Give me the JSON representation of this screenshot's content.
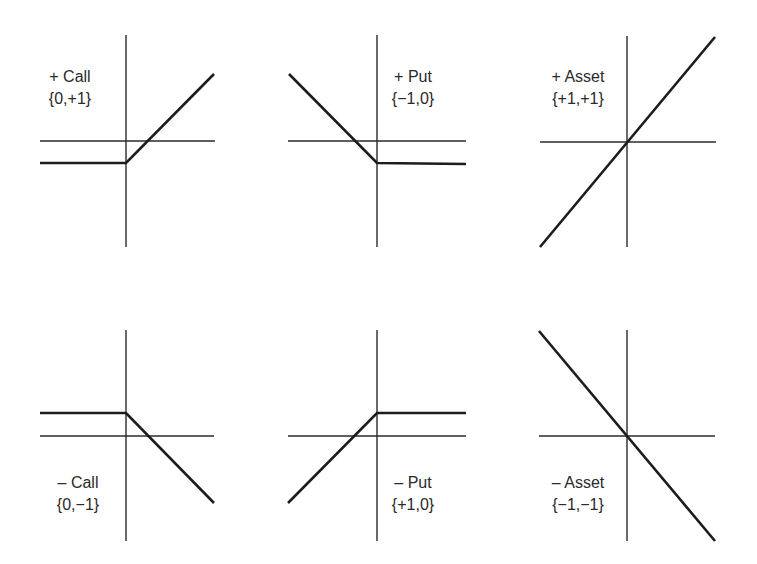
{
  "figure": {
    "title": "",
    "panels": [
      {
        "id": "long-call",
        "name": "+ Call",
        "signature": "{0,+1}",
        "label_pos": {
          "x": 70,
          "y": 66
        },
        "axes": {
          "vx": 126,
          "vy1": 35,
          "vy2": 247,
          "hy": 141,
          "hx1": 40,
          "hx2": 215
        },
        "payoff_points": [
          [
            40,
            163
          ],
          [
            126,
            163
          ],
          [
            214,
            74
          ]
        ]
      },
      {
        "id": "long-put",
        "name": "+ Put",
        "signature": "{−1,0}",
        "label_pos": {
          "x": 413,
          "y": 66
        },
        "axes": {
          "vx": 377,
          "vy1": 35,
          "vy2": 247,
          "hy": 141,
          "hx1": 288,
          "hx2": 466
        },
        "payoff_points": [
          [
            289,
            74
          ],
          [
            377,
            163
          ],
          [
            466,
            164
          ]
        ]
      },
      {
        "id": "long-asset",
        "name": "+ Asset",
        "signature": "{+1,+1}",
        "label_pos": {
          "x": 578,
          "y": 66
        },
        "axes": {
          "vx": 627,
          "vy1": 36,
          "vy2": 247,
          "hy": 142,
          "hx1": 540,
          "hx2": 716
        },
        "payoff_points": [
          [
            540,
            247
          ],
          [
            715,
            37
          ]
        ]
      },
      {
        "id": "short-call",
        "name": "– Call",
        "signature": "{0,−1}",
        "label_pos": {
          "x": 78,
          "y": 472
        },
        "axes": {
          "vx": 126,
          "vy1": 330,
          "vy2": 541,
          "hy": 436,
          "hx1": 40,
          "hx2": 214
        },
        "payoff_points": [
          [
            40,
            413
          ],
          [
            126,
            413
          ],
          [
            214,
            503
          ]
        ]
      },
      {
        "id": "short-put",
        "name": "– Put",
        "signature": "{+1,0}",
        "label_pos": {
          "x": 413,
          "y": 472
        },
        "axes": {
          "vx": 377,
          "vy1": 330,
          "vy2": 541,
          "hy": 436,
          "hx1": 288,
          "hx2": 466
        },
        "payoff_points": [
          [
            288,
            503
          ],
          [
            377,
            413
          ],
          [
            466,
            413
          ]
        ]
      },
      {
        "id": "short-asset",
        "name": "– Asset",
        "signature": "{−1,−1}",
        "label_pos": {
          "x": 578,
          "y": 472
        },
        "axes": {
          "vx": 627,
          "vy1": 330,
          "vy2": 541,
          "hy": 436,
          "hx1": 539,
          "hx2": 715
        },
        "payoff_points": [
          [
            539,
            331
          ],
          [
            715,
            541
          ]
        ]
      }
    ]
  },
  "labels": {
    "p0_name": "+ Call",
    "p0_sig": "{0,+1}",
    "p1_name": "+ Put",
    "p1_sig": "{−1,0}",
    "p2_name": "+ Asset",
    "p2_sig": "{+1,+1}",
    "p3_name": "– Call",
    "p3_sig": "{0,−1}",
    "p4_name": "– Put",
    "p4_sig": "{+1,0}",
    "p5_name": "– Asset",
    "p5_sig": "{−1,−1}"
  },
  "colors": {
    "line": "#1c1c1c",
    "axis": "#2a2a2a",
    "text": "#2a2a2a",
    "background": "#ffffff"
  }
}
